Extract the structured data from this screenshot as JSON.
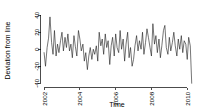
{
  "chart_data": {
    "type": "line",
    "title": "",
    "subtitle": "",
    "xlabel": "Time",
    "ylabel": "Deviation from line",
    "xlim": [
      2001.8,
      2010.35
    ],
    "ylim": [
      -45,
      42
    ],
    "grid": false,
    "legend": null,
    "xticks": [
      2002,
      2004,
      2006,
      2008,
      2010
    ],
    "xtick_labels": [
      "2002",
      "2004",
      "2006",
      "2008",
      "2010"
    ],
    "yticks": [
      -40,
      -20,
      0,
      20,
      40
    ],
    "ytick_labels": [
      "-40",
      "-20",
      "0",
      "20",
      "40"
    ],
    "series": [
      {
        "name": "Deviation from line",
        "color": "#1a1a1a",
        "x": [
          2002.0,
          2002.08,
          2002.17,
          2002.25,
          2002.33,
          2002.42,
          2002.5,
          2002.58,
          2002.67,
          2002.75,
          2002.83,
          2002.92,
          2003.0,
          2003.08,
          2003.17,
          2003.25,
          2003.33,
          2003.42,
          2003.5,
          2003.58,
          2003.67,
          2003.75,
          2003.83,
          2003.92,
          2004.0,
          2004.08,
          2004.17,
          2004.25,
          2004.33,
          2004.42,
          2004.5,
          2004.58,
          2004.67,
          2004.75,
          2004.83,
          2004.92,
          2005.0,
          2005.08,
          2005.17,
          2005.25,
          2005.33,
          2005.42,
          2005.5,
          2005.58,
          2005.67,
          2005.75,
          2005.83,
          2005.92,
          2006.0,
          2006.08,
          2006.17,
          2006.25,
          2006.33,
          2006.42,
          2006.5,
          2006.58,
          2006.67,
          2006.75,
          2006.83,
          2006.92,
          2007.0,
          2007.08,
          2007.17,
          2007.25,
          2007.33,
          2007.42,
          2007.5,
          2007.58,
          2007.67,
          2007.75,
          2007.83,
          2007.92,
          2008.0,
          2008.08,
          2008.17,
          2008.25,
          2008.33,
          2008.42,
          2008.5,
          2008.58,
          2008.67,
          2008.75,
          2008.83,
          2008.92,
          2009.0,
          2009.08,
          2009.17,
          2009.25,
          2009.33,
          2009.42,
          2009.5,
          2009.58,
          2009.67,
          2009.75,
          2009.83,
          2009.92,
          2010.0,
          2010.08,
          2010.17,
          2010.25
        ],
        "values": [
          -4,
          -20,
          2,
          13,
          38,
          8,
          -6,
          22,
          -8,
          6,
          -4,
          10,
          20,
          -2,
          14,
          2,
          18,
          -2,
          6,
          -10,
          16,
          3,
          -8,
          22,
          12,
          -2,
          6,
          -14,
          -4,
          -24,
          -8,
          2,
          -12,
          0,
          -6,
          4,
          -14,
          20,
          4,
          12,
          -6,
          18,
          2,
          10,
          -18,
          4,
          14,
          -8,
          18,
          2,
          -4,
          22,
          0,
          12,
          -14,
          6,
          20,
          -10,
          2,
          -20,
          -12,
          4,
          16,
          -2,
          10,
          0,
          20,
          -6,
          8,
          24,
          14,
          2,
          -8,
          30,
          6,
          16,
          -4,
          12,
          -10,
          4,
          22,
          28,
          2,
          -6,
          14,
          -2,
          8,
          20,
          4,
          -8,
          12,
          0,
          16,
          -4,
          10,
          6,
          -12,
          14,
          4,
          -40
        ]
      }
    ]
  }
}
